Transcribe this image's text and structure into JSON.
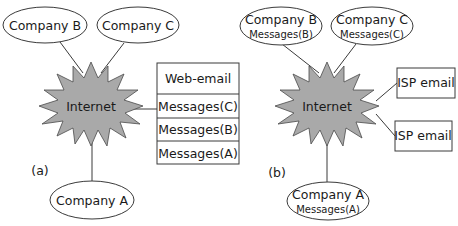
{
  "colors": {
    "internet_fill": "#a9a9a9",
    "stroke": "#3a3a3a",
    "background": "#ffffff"
  },
  "panel_a": {
    "label": "(a)",
    "internet": {
      "label": "Internet"
    },
    "company_b": {
      "name": "Company B"
    },
    "company_c": {
      "name": "Company C"
    },
    "company_a": {
      "name": "Company A"
    },
    "web_email_box": {
      "header": "Web-email",
      "rows": [
        "Messages(C)",
        "Messages(B)",
        "Messages(A)"
      ]
    }
  },
  "panel_b": {
    "label": "(b)",
    "internet": {
      "label": "Internet"
    },
    "company_b": {
      "name": "Company B",
      "messages": "Messages(B)"
    },
    "company_c": {
      "name": "Company C",
      "messages": "Messages(C)"
    },
    "company_a": {
      "name": "Company A",
      "messages": "Messages(A)"
    },
    "isp_boxes": [
      "ISP email",
      "ISP email"
    ]
  }
}
